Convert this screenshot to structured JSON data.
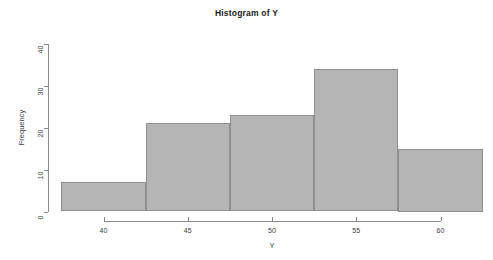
{
  "chart_data": {
    "type": "bar",
    "title": "Histogram of Y",
    "xlabel": "Y",
    "ylabel": "Frequency",
    "bin_edges": [
      37.5,
      42.5,
      47.5,
      52.5,
      57.5,
      62.5
    ],
    "bin_width": 5,
    "categories": [
      "37.5-42.5",
      "42.5-47.5",
      "47.5-52.5",
      "52.5-57.5",
      "57.5-62.5"
    ],
    "values": [
      7,
      21,
      23,
      34,
      15
    ],
    "xlim": [
      37.5,
      62.5
    ],
    "ylim": [
      0,
      40
    ],
    "xticks": [
      40,
      45,
      50,
      55,
      60
    ],
    "xtick_labels": [
      "40",
      "45",
      "50",
      "55",
      "60"
    ],
    "yticks": [
      0,
      10,
      20,
      30,
      40
    ],
    "ytick_labels": [
      "0",
      "10",
      "20",
      "30",
      "40"
    ],
    "grid": false,
    "legend": false,
    "bar_fill_color": "#b5b5b5",
    "bar_border_color": "#8f8f8f",
    "axis_color": "#8a8a8a",
    "text_color": "#3a3a3a",
    "background_color": "#ffffff"
  }
}
